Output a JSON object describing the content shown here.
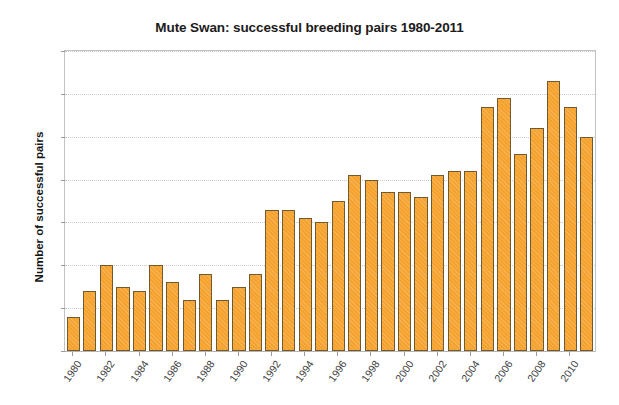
{
  "chart_data": {
    "type": "bar",
    "title": "Mute Swan: successful breeding pairs 1980-2011",
    "xlabel": "",
    "ylabel": "Number of successful pairs",
    "ylim": [
      0,
      70
    ],
    "ytick_step": 10,
    "yticks": [
      0,
      10,
      20,
      30,
      40,
      50,
      60,
      70
    ],
    "grid": true,
    "legend": null,
    "bar_color": "#f5a22f",
    "bar_edge_color": "#6f5a32",
    "categories": [
      "1980",
      "1981",
      "1982",
      "1983",
      "1984",
      "1985",
      "1986",
      "1987",
      "1988",
      "1989",
      "1990",
      "1991",
      "1992",
      "1993",
      "1994",
      "1995",
      "1996",
      "1997",
      "1998",
      "1999",
      "2000",
      "2001",
      "2002",
      "2003",
      "2004",
      "2005",
      "2006",
      "2007",
      "2008",
      "2009",
      "2010",
      "2011"
    ],
    "values": [
      8,
      14,
      20,
      15,
      14,
      20,
      16,
      12,
      18,
      12,
      15,
      18,
      33,
      33,
      31,
      30,
      35,
      41,
      40,
      37,
      37,
      36,
      41,
      42,
      42,
      57,
      59,
      46,
      52,
      63,
      57,
      50
    ],
    "xtick_labels": [
      "1980",
      "1982",
      "1984",
      "1986",
      "1988",
      "1990",
      "1992",
      "1994",
      "1996",
      "1998",
      "2000",
      "2002",
      "2004",
      "2006",
      "2008",
      "2010"
    ]
  }
}
